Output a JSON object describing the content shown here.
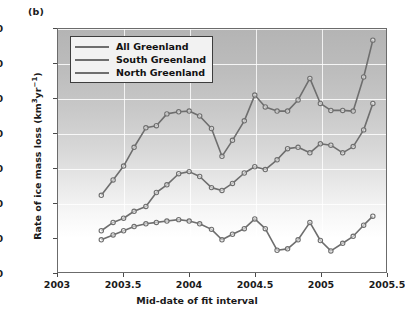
{
  "figure": {
    "panel_label": "(b)",
    "xlabel": "Mid-date of fit interval",
    "ylabel_text": "Rate of ice mass loss (km",
    "ylabel_sup1": "3",
    "ylabel_mid": "yr",
    "ylabel_sup2": "−1",
    "ylabel_end": ")"
  },
  "legend": {
    "items": [
      {
        "label": "All Greenland",
        "color": "#6e6e6e"
      },
      {
        "label": "South Greenland",
        "color": "#6e6e6e"
      },
      {
        "label": "North Greenland",
        "color": "#6e6e6e"
      }
    ]
  },
  "axes": {
    "yticks": [
      "0",
      "50",
      "100",
      "150",
      "200",
      "250",
      "300",
      "350"
    ],
    "xticks": [
      "2003",
      "2003.5",
      "2004",
      "2004.5",
      "2005",
      "2005.5"
    ]
  },
  "chart_data": {
    "type": "line",
    "title": "",
    "xlabel": "Mid-date of fit interval",
    "ylabel": "Rate of ice mass loss (km3 yr-1)",
    "xlim": [
      2003,
      2005.5
    ],
    "ylim": [
      0,
      350
    ],
    "ytick_step": 50,
    "xtick_step": 0.5,
    "grid": true,
    "legend_position": "upper-left-inside",
    "marker": "open-circle",
    "x": [
      2003.33,
      2003.42,
      2003.5,
      2003.58,
      2003.67,
      2003.75,
      2003.83,
      2003.92,
      2004.0,
      2004.08,
      2004.17,
      2004.25,
      2004.33,
      2004.42,
      2004.5,
      2004.58,
      2004.67,
      2004.75,
      2004.83,
      2004.92,
      2005.0,
      2005.08,
      2005.17,
      2005.25,
      2005.33,
      2005.4
    ],
    "series": [
      {
        "name": "All Greenland",
        "color": "#6e6e6e",
        "values": [
          111,
          133,
          153,
          180,
          208,
          211,
          228,
          231,
          232,
          225,
          207,
          167,
          190,
          218,
          255,
          238,
          232,
          232,
          248,
          279,
          243,
          233,
          233,
          232,
          281,
          334
        ]
      },
      {
        "name": "South Greenland",
        "color": "#6e6e6e",
        "values": [
          60,
          72,
          78,
          88,
          95,
          115,
          126,
          142,
          145,
          138,
          122,
          118,
          128,
          143,
          152,
          148,
          162,
          178,
          180,
          172,
          185,
          183,
          172,
          181,
          205,
          243
        ]
      },
      {
        "name": "North Greenland",
        "color": "#6e6e6e",
        "values": [
          47,
          54,
          60,
          66,
          70,
          72,
          74,
          76,
          74,
          70,
          62,
          47,
          55,
          63,
          77,
          63,
          32,
          34,
          47,
          72,
          46,
          31,
          42,
          52,
          68,
          81
        ]
      }
    ]
  }
}
